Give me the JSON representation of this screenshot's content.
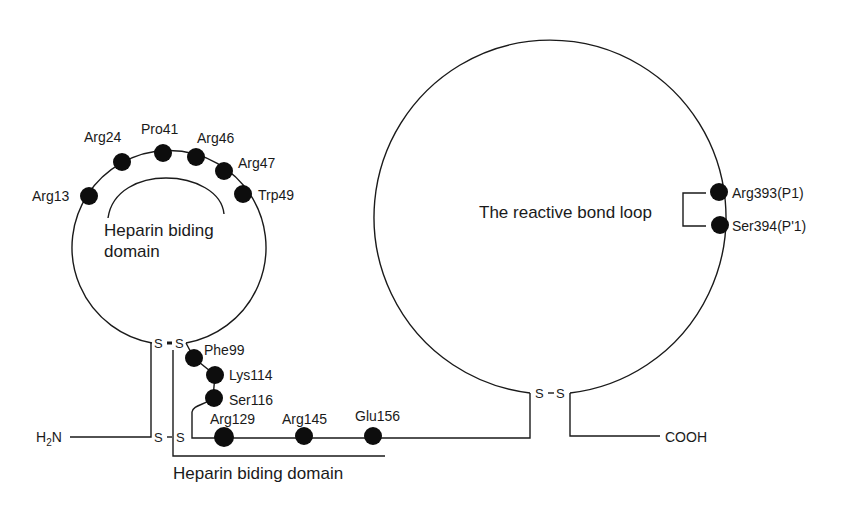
{
  "diagram": {
    "type": "protein-structure-schematic",
    "colors": {
      "line": "#1a1a1a",
      "residue_dot": "#0d0d0d",
      "background": "#ffffff"
    },
    "termini": {
      "n_terminus": "H",
      "n_terminus_sub": "2",
      "n_terminus_suffix": "N",
      "c_terminus": "COOH"
    },
    "disulfide_label": "S",
    "small_loop": {
      "domain_label_line1": "Heparin biding",
      "domain_label_line2": "domain",
      "residues": [
        {
          "label": "Arg13"
        },
        {
          "label": "Arg24"
        },
        {
          "label": "Pro41"
        },
        {
          "label": "Arg46"
        },
        {
          "label": "Arg47"
        },
        {
          "label": "Trp49"
        }
      ]
    },
    "linker": {
      "domain_label": "Heparin biding domain",
      "residues": [
        {
          "label": "Phe99"
        },
        {
          "label": "Lys114"
        },
        {
          "label": "Ser116"
        },
        {
          "label": "Arg129"
        },
        {
          "label": "Arg145"
        },
        {
          "label": "Glu156"
        }
      ]
    },
    "large_loop": {
      "reactive_loop_label": "The reactive bond loop",
      "residues": [
        {
          "label": "Arg393(P1)"
        },
        {
          "label": "Ser394(P'1)"
        }
      ]
    }
  }
}
